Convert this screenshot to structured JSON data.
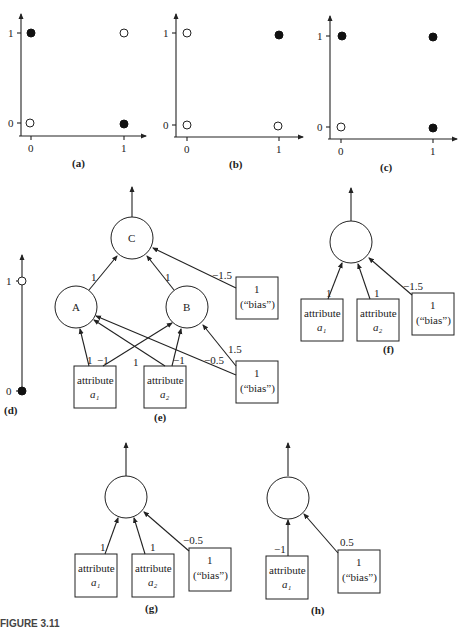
{
  "figure": {
    "caption": "FIGURE 3.11",
    "panel_labels": {
      "a": "(a)",
      "b": "(b)",
      "c": "(c)",
      "d": "(d)",
      "e": "(e)",
      "f": "(f)",
      "g": "(g)",
      "h": "(h)"
    }
  },
  "plots": {
    "tick_0": "0",
    "tick_1": "1",
    "a": {
      "points": [
        {
          "x": 0,
          "y": 1,
          "filled": true
        },
        {
          "x": 1,
          "y": 1,
          "filled": false
        },
        {
          "x": 0,
          "y": 0,
          "filled": false
        },
        {
          "x": 1,
          "y": 0,
          "filled": true
        }
      ]
    },
    "b": {
      "points": [
        {
          "x": 0,
          "y": 1,
          "filled": false
        },
        {
          "x": 1,
          "y": 1,
          "filled": true
        },
        {
          "x": 0,
          "y": 0,
          "filled": false
        },
        {
          "x": 1,
          "y": 0,
          "filled": false
        }
      ]
    },
    "c": {
      "points": [
        {
          "x": 0,
          "y": 1,
          "filled": true
        },
        {
          "x": 1,
          "y": 1,
          "filled": true
        },
        {
          "x": 0,
          "y": 0,
          "filled": false
        },
        {
          "x": 1,
          "y": 0,
          "filled": true
        }
      ]
    },
    "d": {
      "points": [
        {
          "y": 1,
          "filled": false
        },
        {
          "y": 0,
          "filled": true
        }
      ]
    }
  },
  "nodes": {
    "C": "C",
    "A": "A",
    "B": "B",
    "attribute": "attribute",
    "a1": "a₁",
    "a2": "a₂",
    "bias_1": "1",
    "bias_label": "(“bias”)"
  },
  "weights": {
    "e": {
      "A_to_C": "1",
      "B_to_C": "1",
      "bias_to_C": "−1.5",
      "a1_to_A": "1",
      "a1_to_B": "−1",
      "a2_to_A": "1",
      "a2_to_B": "−1",
      "bias_to_B": "1.5",
      "bias_to_A": "−0.5"
    },
    "f": {
      "a1": "1",
      "a2": "1",
      "bias": "−1.5"
    },
    "g": {
      "a1": "1",
      "a2": "1",
      "bias": "−0.5"
    },
    "h": {
      "a1": "−1",
      "bias": "0.5"
    }
  }
}
